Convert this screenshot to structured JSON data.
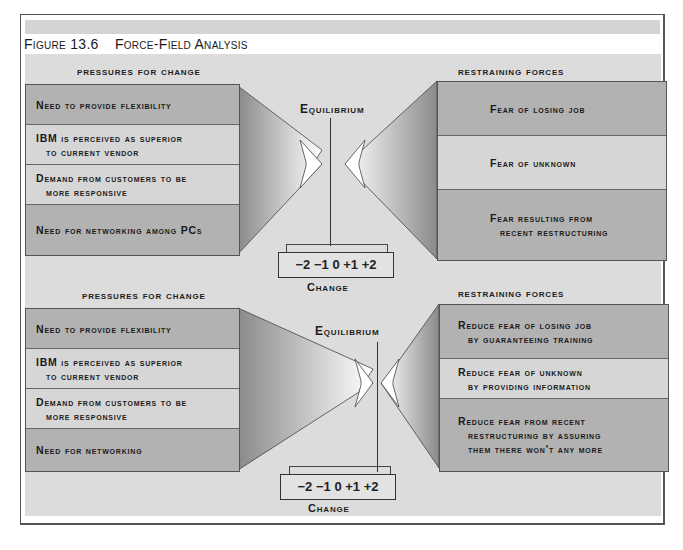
{
  "figure": {
    "number": "Figure 13.6",
    "title": "Force-Field Analysis"
  },
  "panels": [
    {
      "pressures_header": "Pressures for Change",
      "restraining_header": "Restraining Forces",
      "equilibrium_label": "Equilibrium",
      "pressures": [
        {
          "line1": "Need to provide flexibility",
          "line2": ""
        },
        {
          "line1": "IBM is perceived as superior",
          "line2": "to current vendor"
        },
        {
          "line1": "Demand from customers to be",
          "line2": "more responsive"
        },
        {
          "line1": "Need for networking among PCs",
          "line2": ""
        }
      ],
      "restraining": [
        {
          "line1": "Fear of losing job",
          "line2": ""
        },
        {
          "line1": "Fear of unknown",
          "line2": ""
        },
        {
          "line1": "Fear resulting from",
          "line2": "recent restructuring"
        }
      ],
      "scale": "−2 −1 0 +1 +2",
      "scale_label": "Change"
    },
    {
      "pressures_header": "Pressures for Change",
      "restraining_header": "Restraining Forces",
      "equilibrium_label": "Equilibrium",
      "pressures": [
        {
          "line1": "Need to provide flexibility",
          "line2": ""
        },
        {
          "line1": "IBM is perceived as superior",
          "line2": "to current vendor"
        },
        {
          "line1": "Demand from customers to be",
          "line2": "more responsive"
        },
        {
          "line1": "Need for networking",
          "line2": ""
        }
      ],
      "restraining": [
        {
          "line1": "Reduce fear of losing job",
          "line2": "by guaranteeing training"
        },
        {
          "line1": "Reduce fear of unknown",
          "line2": "by providing information"
        },
        {
          "line1": "Reduce fear from recent",
          "line2": "restructuring by assuring",
          "line3": "them there won't any more"
        }
      ],
      "scale": "−2 −1 0 +1 +2",
      "scale_label": "Change"
    }
  ],
  "colors": {
    "background": "#dcdcdc",
    "box_dark": "#b2b2b2",
    "box_light": "#d6d6d6",
    "border": "#555555"
  }
}
